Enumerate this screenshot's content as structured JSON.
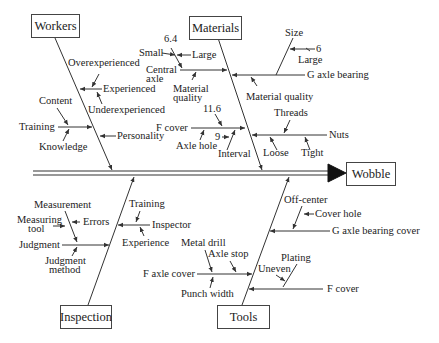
{
  "effect": "Wobble",
  "categories": {
    "workers": "Workers",
    "materials": "Materials",
    "inspection": "Inspection",
    "tools": "Tools"
  },
  "workers": {
    "experienced": "Experienced",
    "overexperienced": "Overexperienced",
    "underexperienced": "Underexperienced",
    "training": "Training",
    "content": "Content",
    "knowledge": "Knowledge",
    "personality": "Personality"
  },
  "materials": {
    "central_axle": "Central\naxle",
    "central_axle_l1": "Central",
    "central_axle_l2": "axle",
    "size_64": "6.4",
    "small": "Small",
    "large1": "Large",
    "material_quality1_l1": "Material",
    "material_quality1_l2": "quality",
    "f_cover": "F cover",
    "val_116": "11.6",
    "val_9": "9",
    "axle_hole": "Axle hole",
    "interval": "Interval",
    "g_axle_bearing": "G axle bearing",
    "size": "Size",
    "val_6": "6",
    "large2": "Large",
    "material_quality2": "Material quality",
    "nuts": "Nuts",
    "threads": "Threads",
    "loose": "Loose",
    "tight": "Tight"
  },
  "inspection": {
    "errors": "Errors",
    "measurement": "Measurement",
    "measuring_tool_l1": "Measuring",
    "measuring_tool_l2": "tool",
    "judgment": "Judgment",
    "judgment_method_l1": "Judgment",
    "judgment_method_l2": "method",
    "inspector": "Inspector",
    "training": "Training",
    "experience": "Experience"
  },
  "tools": {
    "f_axle_cover": "F axle cover",
    "metal_drill": "Metal drill",
    "axle_stop": "Axle stop",
    "punch_width": "Punch width",
    "g_axle_bearing_cover": "G axle bearing cover",
    "off_center": "Off-center",
    "cover_hole": "Cover hole",
    "f_cover": "F cover",
    "plating": "Plating",
    "uneven": "Uneven"
  }
}
